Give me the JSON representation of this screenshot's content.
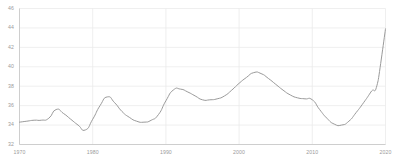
{
  "chart_data": {
    "type": "line",
    "title": "",
    "xlabel": "",
    "ylabel": "",
    "xlim": [
      1970,
      2020
    ],
    "ylim": [
      32,
      46
    ],
    "grid": true,
    "legend": null,
    "line_color": "#9a9a9a",
    "grid_color": "#ebebeb",
    "axis_color": "#c9c9c9",
    "background": "#ffffff",
    "y_ticks": [
      32,
      34,
      36,
      38,
      40,
      42,
      44,
      46
    ],
    "y_tick_labels": [
      "32",
      "34",
      "36",
      "38",
      "40",
      "42",
      "44",
      "46"
    ],
    "x_ticks": [
      1970,
      1980,
      1990,
      2000,
      2010,
      2020
    ],
    "x_tick_labels": [
      "1970",
      "1980",
      "1990",
      "2000",
      "2010",
      "2020"
    ],
    "x": [
      1970,
      1971,
      1972,
      1973,
      1974,
      1975,
      1976,
      1977,
      1978,
      1979,
      1980,
      1981,
      1982,
      1983,
      1984,
      1985,
      1986,
      1987,
      1988,
      1989,
      1990,
      1991,
      1992,
      1993,
      1994,
      1995,
      1996,
      1997,
      1998,
      1999,
      2000,
      2001,
      2002,
      2003,
      2004,
      2005,
      2006,
      2007,
      2008,
      2009,
      2010,
      2011,
      2012,
      2013,
      2014,
      2015,
      2016,
      2017,
      2018,
      2019,
      2020
    ],
    "values": [
      34.3,
      34.4,
      34.5,
      34.5,
      34.7,
      35.6,
      35.2,
      34.6,
      34.0,
      33.5,
      34.6,
      36.0,
      36.9,
      36.3,
      35.4,
      34.8,
      34.4,
      34.3,
      34.5,
      35.1,
      36.5,
      37.6,
      37.7,
      37.4,
      37.0,
      36.6,
      36.6,
      36.7,
      37.0,
      37.6,
      38.3,
      38.9,
      39.4,
      39.3,
      38.8,
      38.2,
      37.6,
      37.1,
      36.8,
      36.7,
      36.6,
      35.6,
      34.7,
      34.1,
      34.0,
      34.4,
      35.3,
      36.3,
      37.4,
      38.6,
      43.9
    ]
  },
  "axes": {
    "y_tick_labels": [
      "46",
      "44",
      "42",
      "40",
      "38",
      "36",
      "34",
      "32"
    ],
    "x_tick_labels": [
      "1970",
      "1980",
      "1990",
      "2000",
      "2010",
      "2020"
    ]
  }
}
